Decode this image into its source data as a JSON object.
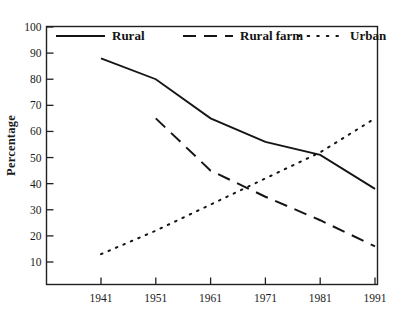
{
  "chart_data": {
    "type": "line",
    "title": "",
    "xlabel": "",
    "ylabel": "Percentage",
    "x": [
      1941,
      1951,
      1961,
      1971,
      1981,
      1991
    ],
    "xtick_labels": [
      "1941",
      "1951",
      "1961",
      "1971",
      "1981",
      "1991"
    ],
    "ytick_labels": [
      "10",
      "20",
      "30",
      "40",
      "50",
      "60",
      "70",
      "80",
      "90",
      "100"
    ],
    "yticks": [
      10,
      20,
      30,
      40,
      50,
      60,
      70,
      80,
      90,
      100
    ],
    "ylim": [
      5,
      100
    ],
    "xlim": [
      1936,
      1995
    ],
    "grid": false,
    "legend_position": "top-inside",
    "series": [
      {
        "name": "Rural",
        "style": "solid",
        "color": "#151515",
        "x": [
          1941,
          1951,
          1961,
          1971,
          1981,
          1991
        ],
        "values": [
          88,
          80,
          65,
          56,
          51,
          38
        ]
      },
      {
        "name": "Rural farm",
        "style": "dashed",
        "color": "#151515",
        "x": [
          1951,
          1961,
          1971,
          1981,
          1991
        ],
        "values": [
          65,
          45,
          35,
          26,
          16
        ]
      },
      {
        "name": "Urban",
        "style": "dotted",
        "color": "#151515",
        "x": [
          1941,
          1951,
          1961,
          1971,
          1981,
          1991
        ],
        "values": [
          13,
          22,
          32,
          42,
          52,
          65
        ]
      }
    ]
  },
  "legend": {
    "items": [
      {
        "label": "Rural",
        "style": "solid"
      },
      {
        "label": "Rural farm",
        "style": "dashed"
      },
      {
        "label": "Urban",
        "style": "dotted"
      }
    ]
  },
  "axis": {
    "y_title": "Percentage"
  }
}
